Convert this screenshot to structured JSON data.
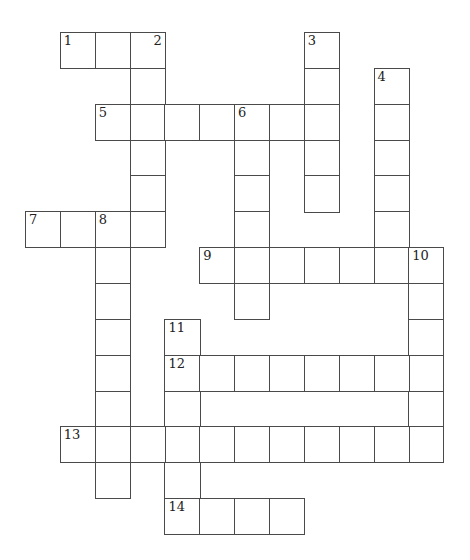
{
  "puzzle": {
    "type": "crossword",
    "grid_origin": {
      "x": 25,
      "y": 32
    },
    "cell_width": 34.85,
    "cell_height": 35.85,
    "line_color": "#4a4a4a",
    "entries": [
      {
        "number": "1",
        "direction": "across",
        "row": 0,
        "col": 1,
        "length": 3
      },
      {
        "number": "2",
        "direction": "down",
        "row": 0,
        "col": 3,
        "length": 6
      },
      {
        "number": "3",
        "direction": "down",
        "row": 0,
        "col": 8,
        "length": 5
      },
      {
        "number": "4",
        "direction": "down",
        "row": 1,
        "col": 10,
        "length": 6
      },
      {
        "number": "5",
        "direction": "across",
        "row": 2,
        "col": 2,
        "length": 7
      },
      {
        "number": "6",
        "direction": "down",
        "row": 2,
        "col": 6,
        "length": 6
      },
      {
        "number": "7",
        "direction": "across",
        "row": 5,
        "col": 0,
        "length": 4
      },
      {
        "number": "8",
        "direction": "down",
        "row": 5,
        "col": 2,
        "length": 8
      },
      {
        "number": "9",
        "direction": "across",
        "row": 6,
        "col": 5,
        "length": 7
      },
      {
        "number": "10",
        "direction": "down",
        "row": 6,
        "col": 11,
        "length": 6
      },
      {
        "number": "11",
        "direction": "down",
        "row": 8,
        "col": 4,
        "length": 6
      },
      {
        "number": "12",
        "direction": "across",
        "row": 9,
        "col": 4,
        "length": 8
      },
      {
        "number": "13",
        "direction": "across",
        "row": 11,
        "col": 1,
        "length": 11
      },
      {
        "number": "14",
        "direction": "across",
        "row": 13,
        "col": 4,
        "length": 4
      }
    ]
  }
}
